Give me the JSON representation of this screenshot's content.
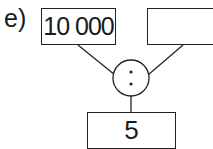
{
  "exercise": {
    "label": "e)",
    "inputs": {
      "left": {
        "value": "10000",
        "display": "10 000"
      },
      "right": {
        "value": "",
        "display": ""
      }
    },
    "operator": {
      "symbol": ":",
      "name": "division"
    },
    "result": {
      "value": "5",
      "display": "5"
    }
  },
  "colors": {
    "stroke": "#222222",
    "background": "#ffffff",
    "text": "#1a1a1a"
  }
}
